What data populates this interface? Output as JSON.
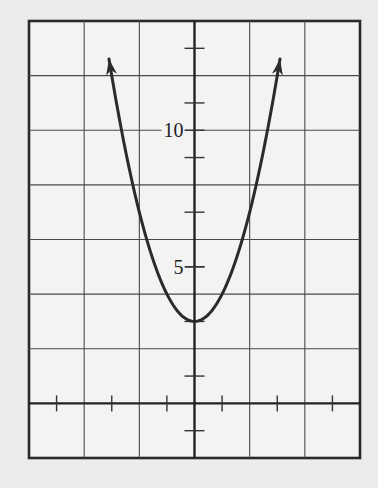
{
  "chart_data": {
    "type": "line",
    "title": "",
    "xlabel": "",
    "ylabel": "",
    "xlim": [
      -6,
      6
    ],
    "ylim": [
      -2,
      14
    ],
    "grid": true,
    "grid_spacing": {
      "x": 2,
      "y": 2
    },
    "tick_spacing": {
      "x": 1,
      "y": 1
    },
    "y_tick_labels": [
      {
        "value": 5,
        "label": "5"
      },
      {
        "value": 10,
        "label": "10"
      }
    ],
    "x_tick_labels": [],
    "legend": null,
    "series": [
      {
        "name": "y = x^2 + 3",
        "function": "x^2 + 3",
        "vertex": [
          0,
          3
        ],
        "domain": [
          -3.1,
          3.1
        ],
        "arrows_at_ends": true,
        "x": [
          -3,
          -2,
          -1,
          0,
          1,
          2,
          3
        ],
        "values": [
          12,
          7,
          4,
          3,
          4,
          7,
          12
        ]
      }
    ],
    "colors": {
      "line": "#2b2b2b",
      "grid": "#4a4a4a",
      "background": "#f3f3f1"
    }
  }
}
